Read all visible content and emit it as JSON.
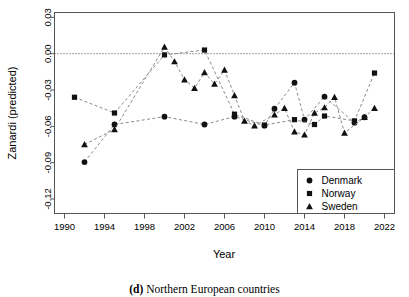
{
  "chart_data": {
    "type": "line",
    "title": "",
    "xlabel": "Year",
    "ylabel": "Zanardi (predicted)",
    "xlim": [
      1989,
      2023
    ],
    "ylim": [
      -0.132,
      0.034
    ],
    "xticks": [
      1990,
      1994,
      1998,
      2002,
      2006,
      2010,
      2014,
      2018,
      2022
    ],
    "yticks": [
      0.03,
      0.0,
      -0.03,
      -0.06,
      -0.09,
      -0.12
    ],
    "ytick_labels": [
      "0.03",
      "0.00",
      "-0.03",
      "-0.06",
      "-0.09",
      "-0.12"
    ],
    "xtick_labels": [
      "1990",
      "1994",
      "1998",
      "2002",
      "2006",
      "2010",
      "2014",
      "2018",
      "2022"
    ],
    "grid": false,
    "reference_line": {
      "y": 0.0,
      "style": "dotted"
    },
    "legend_position": "bottom-right",
    "series": [
      {
        "name": "Denmark",
        "marker": "circle",
        "color": "#111111",
        "x": [
          1992,
          1995,
          2000,
          2004,
          2007,
          2010,
          2011,
          2013,
          2014,
          2016,
          2019,
          2020
        ],
        "y": [
          -0.0895,
          -0.0585,
          -0.052,
          -0.0585,
          -0.052,
          -0.0595,
          -0.0455,
          -0.024,
          -0.0545,
          -0.0355,
          -0.057,
          -0.0525
        ]
      },
      {
        "name": "Norway",
        "marker": "square",
        "color": "#111111",
        "x": [
          1991,
          1995,
          2000,
          2004,
          2007,
          2010,
          2013,
          2015,
          2016,
          2019,
          2021
        ],
        "y": [
          -0.036,
          -0.049,
          -0.001,
          0.003,
          -0.05,
          -0.059,
          -0.0545,
          -0.0585,
          -0.0515,
          -0.0555,
          -0.016
        ]
      },
      {
        "name": "Sweden",
        "marker": "triangle",
        "color": "#111111",
        "x": [
          1992,
          1995,
          2000,
          2001,
          2002,
          2003,
          2004,
          2005,
          2006,
          2007,
          2008,
          2009,
          2011,
          2012,
          2013,
          2014,
          2015,
          2016,
          2017,
          2018,
          2020,
          2021
        ],
        "y": [
          -0.075,
          -0.0625,
          0.0055,
          -0.0065,
          -0.0215,
          -0.0285,
          -0.0155,
          -0.025,
          -0.0135,
          -0.0345,
          -0.0555,
          -0.0595,
          -0.0505,
          -0.045,
          -0.0645,
          -0.067,
          -0.049,
          -0.0445,
          -0.036,
          -0.0655,
          -0.0525,
          -0.045
        ]
      }
    ]
  },
  "axes": {
    "y_axis_title": "Zanardi (predicted)",
    "x_axis_title": "Year"
  },
  "legend": {
    "entries": [
      {
        "label": "Denmark",
        "marker": "circle"
      },
      {
        "label": "Norway",
        "marker": "square"
      },
      {
        "label": "Sweden",
        "marker": "triangle"
      }
    ]
  },
  "caption": {
    "prefix": "(d)",
    "text": "Northern European countries"
  }
}
